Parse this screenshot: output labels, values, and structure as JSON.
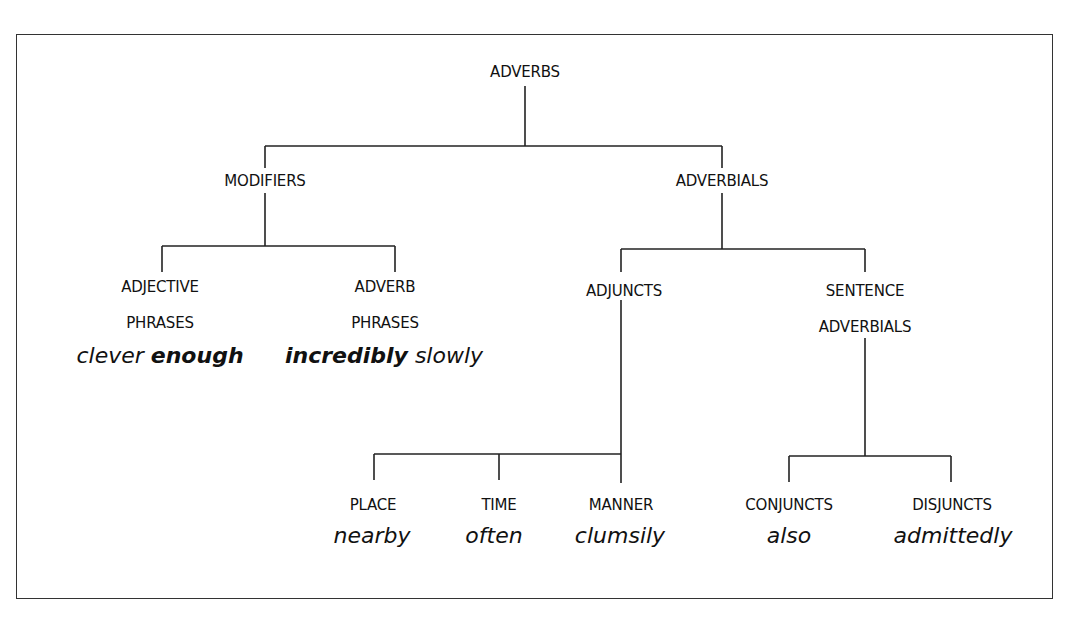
{
  "diagram": {
    "root": "ADVERBS",
    "level1": {
      "modifiers": "MODIFIERS",
      "adverbials": "ADVERBIALS"
    },
    "modifiers_children": {
      "adjective_phrases": {
        "line1": "ADJECTIVE",
        "line2": "PHRASES",
        "example_plain": "clever",
        "example_bold": "enough"
      },
      "adverb_phrases": {
        "line1": "ADVERB",
        "line2": "PHRASES",
        "example_bold": "incredibly",
        "example_plain": "slowly"
      }
    },
    "adverbials_children": {
      "adjuncts": "ADJUNCTS",
      "sentence_adverbials": {
        "line1": "SENTENCE",
        "line2": "ADVERBIALS"
      }
    },
    "adjuncts_children": [
      {
        "label": "PLACE",
        "example": "nearby"
      },
      {
        "label": "TIME",
        "example": "often"
      },
      {
        "label": "MANNER",
        "example": "clumsily"
      }
    ],
    "sentence_adverbials_children": [
      {
        "label": "CONJUNCTS",
        "example": "also"
      },
      {
        "label": "DISJUNCTS",
        "example": "admittedly"
      }
    ]
  }
}
